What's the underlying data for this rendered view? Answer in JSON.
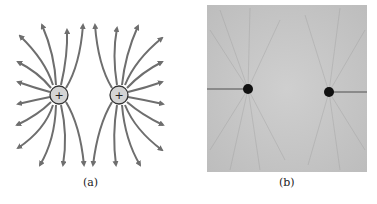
{
  "figure": {
    "panels": [
      {
        "id": "a",
        "caption": "(a)",
        "description": "Electric field lines of two equal positive charges",
        "charges": [
          {
            "sign": "+",
            "x": 59,
            "y": 95
          },
          {
            "sign": "+",
            "x": 119,
            "y": 95
          }
        ]
      },
      {
        "id": "b",
        "caption": "(b)",
        "description": "Photograph of field-line pattern around two like charges"
      }
    ],
    "colors": {
      "field_line": "#6e6e6e",
      "charge_fill": "#d4d4d4",
      "charge_stroke": "#333333",
      "photo_bg": "#c9c9c9",
      "photo_dot": "#111111"
    }
  }
}
